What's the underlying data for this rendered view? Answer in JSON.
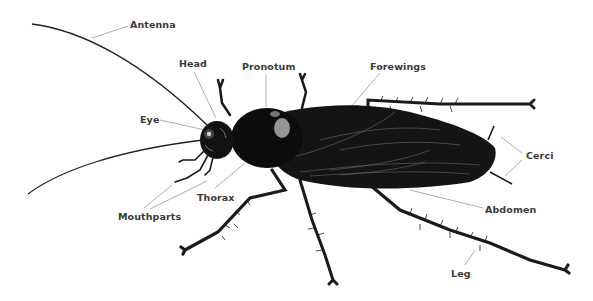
{
  "diagram": {
    "colors": {
      "background": "#ffffff",
      "label_text": "#3a3a3a",
      "leader_line": "#9a9a9a",
      "body": "#111111",
      "highlight": "#d8d8d8"
    },
    "labels": [
      {
        "id": "antenna",
        "text": "Antenna",
        "x": 130,
        "y": 19
      },
      {
        "id": "head",
        "text": "Head",
        "x": 179,
        "y": 58
      },
      {
        "id": "pronotum",
        "text": "Pronotum",
        "x": 242,
        "y": 61
      },
      {
        "id": "forewings",
        "text": "Forewings",
        "x": 370,
        "y": 61
      },
      {
        "id": "eye",
        "text": "Eye",
        "x": 140,
        "y": 114
      },
      {
        "id": "cerci",
        "text": "Cerci",
        "x": 526,
        "y": 150
      },
      {
        "id": "thorax",
        "text": "Thorax",
        "x": 197,
        "y": 192
      },
      {
        "id": "mouthparts",
        "text": "Mouthparts",
        "x": 118,
        "y": 211
      },
      {
        "id": "abdomen",
        "text": "Abdomen",
        "x": 485,
        "y": 204
      },
      {
        "id": "leg",
        "text": "Leg",
        "x": 451,
        "y": 268
      }
    ]
  }
}
